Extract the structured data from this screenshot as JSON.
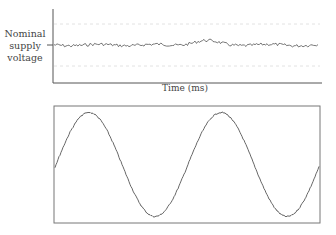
{
  "chart_data": [
    {
      "type": "line",
      "title": "",
      "ylabel": "Nominal supply voltage",
      "xlabel": "Time (ms)",
      "ytick_labels": [
        "Nominal supply voltage"
      ],
      "grid": "dashed horizontal lines above and below nominal",
      "description": "Small noisy fluctuation around the nominal supply voltage level over time, with a slight bump near the middle",
      "series": [
        {
          "name": "supply voltage",
          "style": "thin gray line with noise"
        }
      ]
    },
    {
      "type": "line",
      "title": "",
      "xlabel": "",
      "ylabel": "",
      "description": "Sine wave with slight noise, about two full cycles inside a framed box",
      "cycles": 2,
      "series": [
        {
          "name": "sine waveform",
          "style": "thin gray line with noise"
        }
      ]
    }
  ],
  "labels": {
    "y_label_lines": [
      "Nominal",
      "supply",
      "voltage"
    ],
    "x_label": "Time (ms)"
  },
  "colors": {
    "line": "#555555",
    "axis": "#555555",
    "grid": "#dddddd"
  }
}
